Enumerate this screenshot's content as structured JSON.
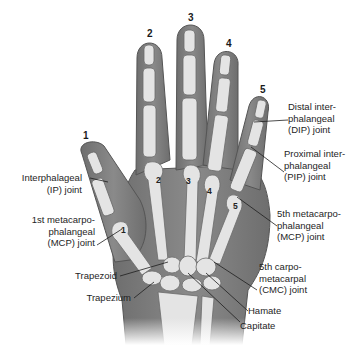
{
  "figure": {
    "colors": {
      "skin": "#7d7d7d",
      "skin_outline": "#5a5a5a",
      "bone": "#e4e4e4",
      "bone_outline": "#6b6b6b",
      "text": "#1e1e1e"
    }
  },
  "digit_numbers": [
    {
      "id": "digit-1",
      "label": "1"
    },
    {
      "id": "digit-2",
      "label": "2"
    },
    {
      "id": "digit-3",
      "label": "3"
    },
    {
      "id": "digit-4",
      "label": "4"
    },
    {
      "id": "digit-5",
      "label": "5"
    }
  ],
  "metacarpal_numbers": [
    {
      "id": "metacarpal-1",
      "label": "1"
    },
    {
      "id": "metacarpal-2",
      "label": "2"
    },
    {
      "id": "metacarpal-3",
      "label": "3"
    },
    {
      "id": "metacarpal-4",
      "label": "4"
    },
    {
      "id": "metacarpal-5",
      "label": "5"
    }
  ],
  "labels": {
    "dip": {
      "line1": "Distal inter-",
      "line2": "phalangeal",
      "line3": "(DIP) joint"
    },
    "pip": {
      "line1": "Proximal inter-",
      "line2": "phalangeal",
      "line3": "(PIP) joint"
    },
    "mcp5": {
      "line1": "5th metacarpo-",
      "line2": "phalangeal",
      "line3": "(MCP) joint"
    },
    "cmc5": {
      "line1": "5th carpo-",
      "line2": "metacarpal",
      "line3": "(CMC) joint"
    },
    "ip": {
      "line1": "Interphalageal",
      "line2": "(IP) joint"
    },
    "mcp1": {
      "line1": "1st metacarpo-",
      "line2": "phalangeal",
      "line3": "(MCP) joint"
    },
    "trapezoid": "Trapezoid",
    "trapezium": "Trapezium",
    "hamate": "Hamate",
    "capitate": "Capitate"
  }
}
